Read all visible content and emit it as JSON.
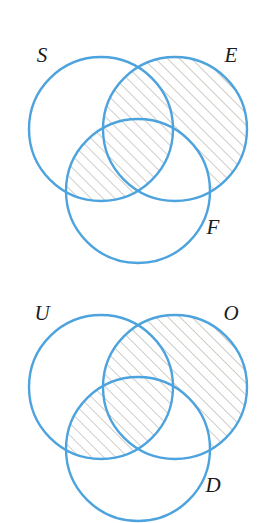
{
  "figure": {
    "background_color": "#ffffff",
    "circle_stroke_color": "#4da3dd",
    "circle_stroke_width": 2.4,
    "hatch_color": "#8a8276",
    "hatch_angle_deg": 45,
    "hatch_spacing_px": 8.5,
    "hatch_stroke_width": 0.8,
    "label_color": "#1a1a1a",
    "label_style": "italic serif"
  },
  "diagrams": [
    {
      "id": "venn-1",
      "labels": {
        "left": "S",
        "right": "E",
        "bottom": "F"
      },
      "label_positions": {
        "left": {
          "x": 42,
          "y": 62
        },
        "right": {
          "x": 231,
          "y": 62
        },
        "bottom": {
          "x": 213,
          "y": 234
        }
      },
      "circles": [
        {
          "name": "left",
          "label": "S",
          "cx": 101,
          "cy": 129,
          "r": 72
        },
        {
          "name": "right",
          "label": "E",
          "cx": 175,
          "cy": 129,
          "r": 72
        },
        {
          "name": "bottom",
          "label": "F",
          "cx": 138,
          "cy": 191,
          "r": 72
        }
      ],
      "shaded_description": "right circle excluding bottom circle, union left circle intersect bottom circle",
      "shaded_regions": [
        "E-minus-F",
        "S-intersect-F"
      ]
    },
    {
      "id": "venn-2",
      "labels": {
        "left": "U",
        "right": "O",
        "bottom": "D"
      },
      "label_positions": {
        "left": {
          "x": 42,
          "y": 62
        },
        "right": {
          "x": 231,
          "y": 62
        },
        "bottom": {
          "x": 213,
          "y": 234
        }
      },
      "circles": [
        {
          "name": "left",
          "label": "U",
          "cx": 101,
          "cy": 129,
          "r": 72
        },
        {
          "name": "right",
          "label": "O",
          "cx": 175,
          "cy": 129,
          "r": 72
        },
        {
          "name": "bottom",
          "label": "D",
          "cx": 138,
          "cy": 191,
          "r": 72
        }
      ],
      "shaded_description": "right circle excluding bottom circle, union left circle intersect bottom circle",
      "shaded_regions": [
        "O-minus-D",
        "U-intersect-D"
      ]
    }
  ]
}
